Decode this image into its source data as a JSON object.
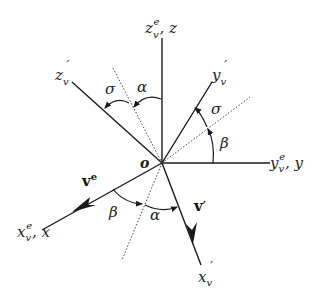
{
  "diagram": {
    "type": "coordinate-frame-rotation",
    "origin_label": "o",
    "axes": {
      "z": {
        "base": "z",
        "sub": "v",
        "sup": "e",
        "suffix": ", z"
      },
      "y": {
        "base": "y",
        "sub": "v",
        "sup": "e",
        "suffix": ", y"
      },
      "x": {
        "base": "x",
        "sub": "v",
        "sup": "e",
        "suffix": ", x"
      },
      "z_prime": {
        "base": "z",
        "sub": "v",
        "prime": "′"
      },
      "y_prime": {
        "base": "y",
        "sub": "v",
        "prime": "′"
      },
      "x_prime": {
        "base": "x",
        "sub": "v",
        "prime": "′"
      }
    },
    "vectors": {
      "ve": {
        "base": "v",
        "sup": "e"
      },
      "vprime": {
        "base": "v",
        "prime": "′"
      }
    },
    "angles": {
      "sigma_top": "σ",
      "alpha_top": "α",
      "sigma_right": "σ",
      "beta_right": "β",
      "beta_bottom": "β",
      "alpha_bottom": "α"
    },
    "colors": {
      "line": "#1a1a1a",
      "background": "#ffffff"
    }
  }
}
